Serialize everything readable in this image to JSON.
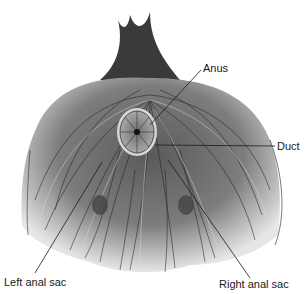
{
  "figure": {
    "labels": [
      {
        "id": "anus",
        "text": "Anus",
        "x": 203,
        "y": 62
      },
      {
        "id": "duct",
        "text": "Duct",
        "x": 277,
        "y": 140
      },
      {
        "id": "left-anal-sac",
        "text": "Left anal sac",
        "x": 4,
        "y": 276
      },
      {
        "id": "right-anal-sac",
        "text": "Right anal sac",
        "x": 219,
        "y": 278
      }
    ],
    "colors": {
      "ink": "#1a1a1a",
      "fur_mid": "#7a7a7a",
      "fur_light": "#c8c8c8",
      "anus_fill": "#9a9a9a",
      "background": "#ffffff"
    }
  }
}
